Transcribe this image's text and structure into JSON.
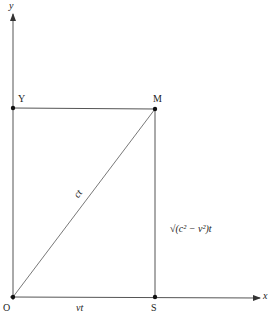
{
  "diagram": {
    "axes": {
      "x_label": "x",
      "y_label": "y"
    },
    "points": {
      "origin": "O",
      "y_point": "Y",
      "m_point": "M",
      "s_point": "S"
    },
    "segments": {
      "hypotenuse": "ct",
      "base": "vt",
      "vertical": "√(c² − v²)t"
    },
    "colors": {
      "line": "#555555",
      "point": "#111111"
    }
  }
}
